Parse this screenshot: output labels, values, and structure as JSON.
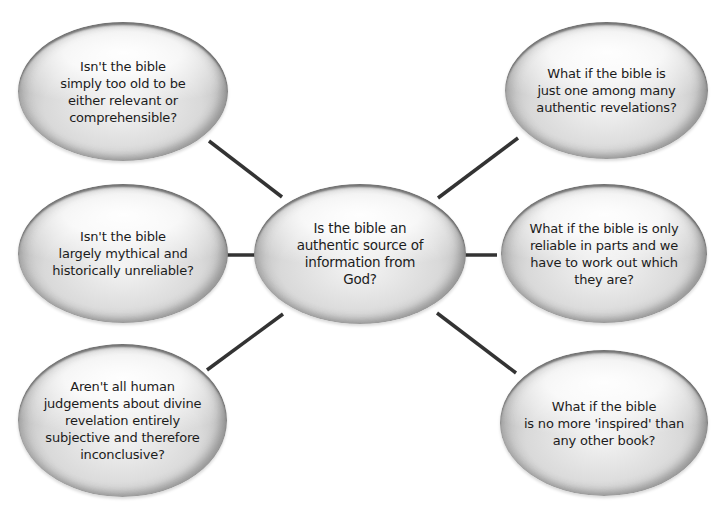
{
  "diagram": {
    "type": "mind-map",
    "line_color": "#333333",
    "center": {
      "text": "Is the bible an\nauthentic source of\ninformation from\nGod?"
    },
    "nodes": [
      {
        "position": "top-left",
        "text": "Isn't the bible\nsimply too old to be\neither relevant or\ncomprehensible?"
      },
      {
        "position": "middle-left",
        "text": "Isn't the bible\nlargely mythical and\nhistorically unreliable?"
      },
      {
        "position": "bottom-left",
        "text": "Aren't all human\njudgements about divine\nrevelation entirely\nsubjective and therefore\ninconclusive?"
      },
      {
        "position": "top-right",
        "text": "What if the bible is\njust one among many\nauthentic revelations?"
      },
      {
        "position": "middle-right",
        "text": "What if the bible is only\nreliable in parts and we\nhave to work out which\nthey are?"
      },
      {
        "position": "bottom-right",
        "text": "What if the bible\nis no more 'inspired' than\nany other book?"
      }
    ]
  }
}
